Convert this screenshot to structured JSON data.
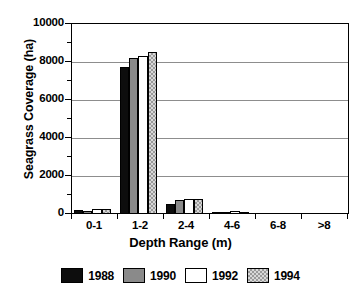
{
  "chart_data": {
    "type": "bar",
    "title": "",
    "xlabel": "Depth Range (m)",
    "ylabel": "Seagrass Coverage (ha)",
    "categories": [
      "0-1",
      "1-2",
      "2-4",
      "4-6",
      "6-8",
      ">8"
    ],
    "series": [
      {
        "name": "1988",
        "color": "#0d0d0d",
        "pattern": "solid-black",
        "values": [
          200,
          7720,
          550,
          110,
          0,
          0
        ]
      },
      {
        "name": "1990",
        "color": "#8a8a8a",
        "pattern": "solid-gray",
        "values": [
          180,
          8220,
          740,
          120,
          0,
          0
        ]
      },
      {
        "name": "1992",
        "color": "#ffffff",
        "pattern": "solid-white",
        "values": [
          250,
          8320,
          790,
          140,
          0,
          0
        ]
      },
      {
        "name": "1994",
        "color": "#d8d8d8",
        "pattern": "checker",
        "values": [
          240,
          8520,
          790,
          100,
          0,
          0
        ]
      }
    ],
    "ylim": [
      0,
      10000
    ],
    "yticks": [
      0,
      2000,
      4000,
      6000,
      8000,
      10000
    ],
    "ytick_labels": [
      "0",
      "2000",
      "4000",
      "6000",
      "8000",
      "10000"
    ],
    "yminor_ticks": [
      1000,
      3000,
      5000,
      7000,
      9000
    ],
    "grid": "horizontal",
    "legend_position": "bottom",
    "legend_entries": [
      "1988",
      "1990",
      "1992",
      "1994"
    ]
  }
}
